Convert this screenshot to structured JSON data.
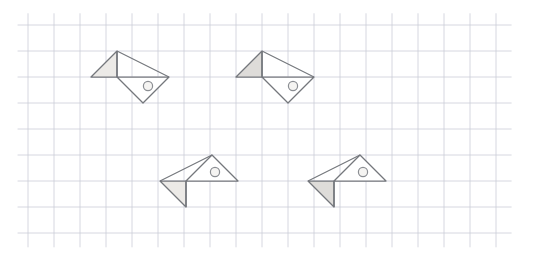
{
  "page": {
    "background_color": "#ffffff",
    "width": 539,
    "height": 255
  },
  "grid": {
    "label": "graph-paper grid",
    "cell_size": 26,
    "origin_x": 28,
    "origin_y": 25,
    "columns": 18,
    "rows": 8,
    "line_color": "#c9ccd6",
    "line_width": 0.9,
    "visible": true
  },
  "palette": {
    "outline": "#74777c",
    "fill_light": "#eceae7",
    "fill_mid": "#dedcd9",
    "circle_stroke": "#8b8e93",
    "circle_fill": "#f5f4f2",
    "background": "#ffffff"
  },
  "figures": [
    {
      "id": "figure-1",
      "name": "zigzag-shape-top-left",
      "orientation": "up-left wing raised",
      "shading": "light",
      "fill": "#eceae7",
      "outline_points": "117,51 91,77 117,77 169,77 143,103",
      "upper_triangle_points": "117,51 91,77 117,77",
      "lower_triangle_points": "117,77 169,77 143,103",
      "spine": "117,51 117,77",
      "body_edges": "117,51 169,77",
      "circle": {
        "cx": 148,
        "cy": 86,
        "r": 4.6
      },
      "shaded_region": "upper"
    },
    {
      "id": "figure-2",
      "name": "zigzag-shape-top-right",
      "orientation": "up-left wing raised",
      "shading": "mid",
      "fill": "#dedcd9",
      "outline_points": "262,51 236,77 262,77 314,77 288,103",
      "upper_triangle_points": "262,51 236,77 262,77",
      "lower_triangle_points": "262,77 314,77 288,103",
      "spine": "262,51 262,77",
      "body_edges": "262,51 314,77",
      "circle": {
        "cx": 293,
        "cy": 86,
        "r": 4.6
      },
      "shaded_region": "upper"
    },
    {
      "id": "figure-3",
      "name": "zigzag-shape-bottom-left",
      "orientation": "down-left wing lowered",
      "shading": "light",
      "fill": "#eceae7",
      "outline_points": "212,155 238,181 186,181 160,181 186,207",
      "upper_triangle_points": "212,155 186,181 238,181",
      "lower_triangle_points": "186,181 160,181 186,207",
      "spine": "186,181 186,207",
      "body_edges": "212,155 160,181",
      "circle": {
        "cx": 215,
        "cy": 172,
        "r": 4.6
      },
      "shaded_region": "lower"
    },
    {
      "id": "figure-4",
      "name": "zigzag-shape-bottom-right",
      "orientation": "down-left wing lowered",
      "shading": "mid",
      "fill": "#dedcd9",
      "outline_points": "360,155 386,181 334,181 308,181 334,207",
      "upper_triangle_points": "360,155 334,181 386,181",
      "lower_triangle_points": "334,181 308,181 334,207",
      "spine": "334,181 334,207",
      "body_edges": "360,155 308,181",
      "circle": {
        "cx": 363,
        "cy": 172,
        "r": 4.6
      },
      "shaded_region": "lower"
    }
  ]
}
